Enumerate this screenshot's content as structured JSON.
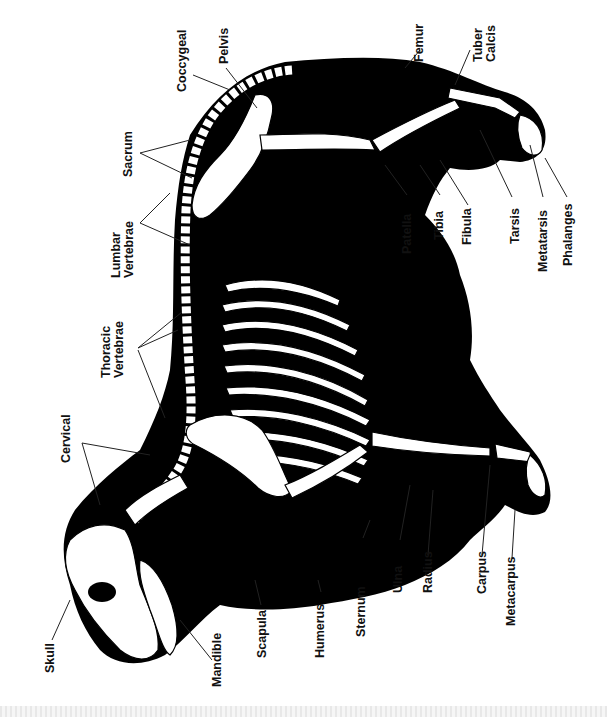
{
  "diagram": {
    "colors": {
      "silhouette": "#000000",
      "bone": "#ffffff",
      "label": "#111111",
      "leader": "#222222",
      "background": "#ffffff"
    },
    "labels": {
      "coccygeal": "Coccygeal",
      "pelvis": "Pelvis",
      "sacrum": "Sacrum",
      "lumbar_1": "Lumbar",
      "lumbar_2": "Vertebrae",
      "thoracic_1": "Thoracic",
      "thoracic_2": "Vertebrae",
      "cervical": "Cervical",
      "skull": "Skull",
      "mandible": "Mandible",
      "scapula": "Scapula",
      "humerus": "Humerus",
      "sternum": "Sternum",
      "ulna": "Ulna",
      "radius": "Radius",
      "carpus": "Carpus",
      "metacarpus": "Metacarpus",
      "femur": "Femur",
      "tuber_1": "Tuber",
      "tuber_2": "Calcis",
      "patella": "Patella",
      "tibia": "Tibia",
      "fibula": "Fibula",
      "tarsis": "Tarsis",
      "metatarsis": "Metatarsis",
      "phalanges": "Phalanges"
    }
  }
}
